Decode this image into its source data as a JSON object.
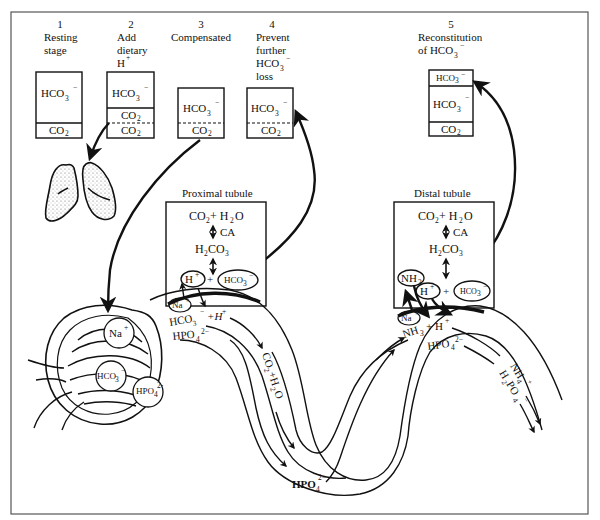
{
  "figure": {
    "stages": [
      {
        "number": "1",
        "label_lines": [
          "Resting",
          "stage"
        ],
        "compartments": [
          "HCO3−",
          "CO2"
        ]
      },
      {
        "number": "2",
        "label_lines": [
          "Add",
          "dietary",
          "H+"
        ],
        "compartments": [
          "HCO3−",
          "CO2",
          "CO2"
        ]
      },
      {
        "number": "3",
        "label_lines": [
          "Compensated"
        ],
        "compartments": [
          "HCO3−",
          "CO2"
        ]
      },
      {
        "number": "4",
        "label_lines": [
          "Prevent",
          "further",
          "HCO3−",
          "loss"
        ],
        "compartments": [
          "HCO3−",
          "CO2"
        ]
      },
      {
        "number": "5",
        "label_lines": [
          "Reconstitution",
          "of HCO3−"
        ],
        "compartments": [
          "HCO3−",
          "HCO3−",
          "CO2"
        ]
      }
    ],
    "lungs_label": "lungs",
    "proximal": {
      "title": "Proximal tubule",
      "reaction_top": "CO2 + H2O",
      "enzyme": "CA",
      "intermediate": "H2CO3",
      "h_ion": "H+",
      "plus": "+",
      "bicarb": "HCO3−",
      "na": "Na+",
      "lumen_line1": "HCO3− + H+",
      "lumen_line2": "HPO42−",
      "product": "CO2 + H2O"
    },
    "glomerulus": {
      "na": "Na+",
      "bicarb": "HCO3−",
      "phosphate": "HPO42−"
    },
    "loop": {
      "phosphate": "HPO42−"
    },
    "distal": {
      "title": "Distal tubule",
      "reaction_top": "CO2 + H2O",
      "enzyme": "CA",
      "intermediate": "H2CO3",
      "nh3": "NH3",
      "h_ion": "H+",
      "plus": "+",
      "bicarb": "HCO3−",
      "na": "Na+",
      "lumen_line1": "NH3 + H+",
      "lumen_line2": "HPO42−",
      "product1": "NH4+",
      "product2": "H2PO4−"
    }
  }
}
